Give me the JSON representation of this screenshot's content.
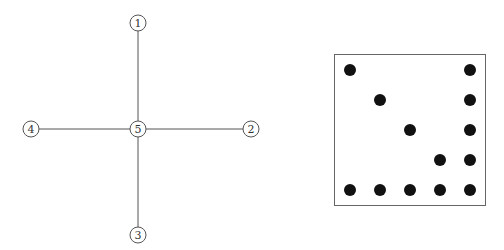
{
  "graph": {
    "type": "star",
    "node_radius": 8,
    "nodes": [
      {
        "id": "1",
        "label": "1",
        "x": 138,
        "y": 23
      },
      {
        "id": "2",
        "label": "2",
        "x": 251,
        "y": 129
      },
      {
        "id": "3",
        "label": "3",
        "x": 138,
        "y": 235
      },
      {
        "id": "4",
        "label": "4",
        "x": 31,
        "y": 129
      },
      {
        "id": "5",
        "label": "5",
        "x": 138,
        "y": 129
      }
    ],
    "edges": [
      {
        "from": "5",
        "to": "1"
      },
      {
        "from": "5",
        "to": "2"
      },
      {
        "from": "5",
        "to": "3"
      },
      {
        "from": "5",
        "to": "4"
      }
    ]
  },
  "matrix": {
    "box": {
      "x": 334,
      "y": 54,
      "width": 151,
      "height": 151
    },
    "grid_size": 5,
    "dot_radius": 6,
    "col_x": [
      350,
      380,
      410,
      440,
      470
    ],
    "row_y": [
      70,
      100,
      130,
      160,
      190
    ],
    "filled": [
      [
        1,
        0,
        0,
        0,
        1
      ],
      [
        0,
        1,
        0,
        0,
        1
      ],
      [
        0,
        0,
        1,
        0,
        1
      ],
      [
        0,
        0,
        0,
        1,
        1
      ],
      [
        1,
        1,
        1,
        1,
        1
      ]
    ]
  }
}
